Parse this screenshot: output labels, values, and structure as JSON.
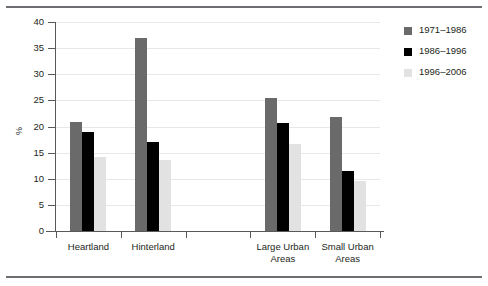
{
  "figure": {
    "top_rule_color": "#6d6e71",
    "bottom_rule_color": "#6d6e71"
  },
  "chart_data": {
    "type": "bar",
    "title": "",
    "xlabel": "",
    "ylabel": "%",
    "ylim": [
      0,
      40
    ],
    "ytick_values": [
      0,
      5,
      10,
      15,
      20,
      25,
      30,
      35,
      40
    ],
    "ytick_labels": [
      "0",
      "5",
      "10",
      "15",
      "20",
      "25",
      "30",
      "35",
      "40"
    ],
    "grid": true,
    "legend_position": "right",
    "categories": [
      "Heartland",
      "Hinterland",
      "",
      "Large Urban\nAreas",
      "Small Urban\nAreas"
    ],
    "category_labels": [
      {
        "line1": "Heartland",
        "line2": ""
      },
      {
        "line1": "Hinterland",
        "line2": ""
      },
      {
        "line1": "",
        "line2": ""
      },
      {
        "line1": "Large Urban",
        "line2": "Areas"
      },
      {
        "line1": "Small Urban",
        "line2": "Areas"
      }
    ],
    "series": [
      {
        "name": "1971–1986",
        "color": "#6a6a6a",
        "values": [
          20.8,
          37.0,
          null,
          25.5,
          21.8
        ]
      },
      {
        "name": "1986–1996",
        "color": "#010101",
        "values": [
          19.0,
          17.1,
          null,
          20.7,
          11.5
        ]
      },
      {
        "name": "1996–2006",
        "color": "#e2e2e2",
        "values": [
          14.2,
          13.5,
          null,
          16.6,
          9.6
        ]
      }
    ]
  },
  "legend": {
    "items": [
      {
        "label": "1971–1986",
        "color": "#6a6a6a"
      },
      {
        "label": "1986–1996",
        "color": "#010101"
      },
      {
        "label": "1996–2006",
        "color": "#e2e2e2"
      }
    ]
  }
}
